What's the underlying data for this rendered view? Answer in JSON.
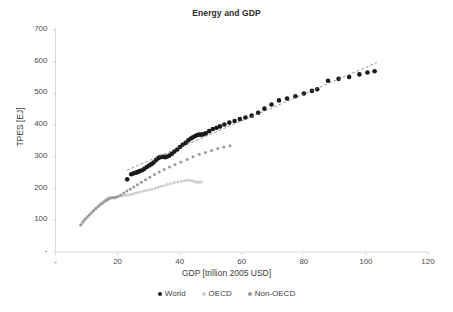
{
  "chart_data": {
    "type": "scatter",
    "title": "Energy and GDP",
    "xlabel": "GDP [trillion 2005 USD]",
    "ylabel": "TPES [EJ]",
    "xlim": [
      0,
      120
    ],
    "ylim": [
      0,
      700
    ],
    "xticks": [
      "-",
      "20",
      "40",
      "60",
      "80",
      "100",
      "120"
    ],
    "xtick_values": [
      0,
      20,
      40,
      60,
      80,
      100,
      120
    ],
    "yticks": [
      "-",
      "100",
      "200",
      "300",
      "400",
      "500",
      "600",
      "700"
    ],
    "ytick_values": [
      0,
      100,
      200,
      300,
      400,
      500,
      600,
      700
    ],
    "grid": false,
    "legend_position": "bottom",
    "series": [
      {
        "name": "World",
        "color": "#1a1a1a",
        "marker": "circle",
        "points": [
          [
            23.1,
            229
          ],
          [
            24.4,
            245
          ],
          [
            25.2,
            248
          ],
          [
            25.9,
            250
          ],
          [
            26.4,
            252
          ],
          [
            27.1,
            255
          ],
          [
            27.9,
            258
          ],
          [
            28.6,
            262
          ],
          [
            29.4,
            268
          ],
          [
            30.2,
            273
          ],
          [
            30.9,
            277
          ],
          [
            31.6,
            282
          ],
          [
            32.4,
            290
          ],
          [
            33.1,
            296
          ],
          [
            33.7,
            299
          ],
          [
            34.3,
            300
          ],
          [
            34.9,
            300
          ],
          [
            35.4,
            299
          ],
          [
            36.0,
            301
          ],
          [
            36.7,
            304
          ],
          [
            37.5,
            310
          ],
          [
            38.3,
            317
          ],
          [
            39.2,
            323
          ],
          [
            40.1,
            331
          ],
          [
            41.0,
            338
          ],
          [
            41.9,
            344
          ],
          [
            42.8,
            352
          ],
          [
            43.6,
            358
          ],
          [
            44.3,
            362
          ],
          [
            45.0,
            366
          ],
          [
            45.7,
            369
          ],
          [
            46.3,
            370
          ],
          [
            46.9,
            370
          ],
          [
            47.6,
            371
          ],
          [
            48.4,
            374
          ],
          [
            49.5,
            381
          ],
          [
            50.7,
            388
          ],
          [
            51.9,
            392
          ],
          [
            53.0,
            396
          ],
          [
            54.4,
            402
          ],
          [
            56.0,
            408
          ],
          [
            57.7,
            413
          ],
          [
            59.4,
            419
          ],
          [
            61.2,
            424
          ],
          [
            63.2,
            430
          ],
          [
            65.3,
            439
          ],
          [
            67.3,
            452
          ],
          [
            69.6,
            465
          ],
          [
            72.0,
            478
          ],
          [
            74.6,
            484
          ],
          [
            77.3,
            491
          ],
          [
            80.0,
            500
          ],
          [
            82.6,
            508
          ],
          [
            84.3,
            513
          ],
          [
            87.8,
            540
          ],
          [
            91.2,
            546
          ],
          [
            94.6,
            552
          ],
          [
            97.9,
            560
          ],
          [
            100.5,
            566
          ],
          [
            102.8,
            570
          ]
        ]
      },
      {
        "name": "OECD",
        "color": "#cfcfcf",
        "marker": "circle",
        "points": [
          [
            8.0,
            84
          ],
          [
            8.6,
            92
          ],
          [
            9.2,
            100
          ],
          [
            9.8,
            106
          ],
          [
            10.4,
            112
          ],
          [
            11.0,
            118
          ],
          [
            11.6,
            124
          ],
          [
            12.2,
            130
          ],
          [
            12.8,
            136
          ],
          [
            13.4,
            142
          ],
          [
            14.0,
            148
          ],
          [
            14.6,
            153
          ],
          [
            15.2,
            158
          ],
          [
            15.8,
            163
          ],
          [
            16.4,
            167
          ],
          [
            17.0,
            171
          ],
          [
            17.6,
            173
          ],
          [
            18.2,
            172
          ],
          [
            18.8,
            170
          ],
          [
            19.4,
            172
          ],
          [
            20.0,
            174
          ],
          [
            20.7,
            176
          ],
          [
            21.4,
            177
          ],
          [
            22.1,
            178
          ],
          [
            22.8,
            179
          ],
          [
            23.5,
            180
          ],
          [
            24.3,
            182
          ],
          [
            25.1,
            184
          ],
          [
            25.9,
            186
          ],
          [
            26.7,
            188
          ],
          [
            27.5,
            190
          ],
          [
            28.4,
            192
          ],
          [
            29.3,
            194
          ],
          [
            30.2,
            196
          ],
          [
            31.1,
            198
          ],
          [
            32.1,
            201
          ],
          [
            33.1,
            204
          ],
          [
            34.1,
            207
          ],
          [
            35.1,
            210
          ],
          [
            36.1,
            213
          ],
          [
            37.2,
            216
          ],
          [
            38.3,
            219
          ],
          [
            39.4,
            221
          ],
          [
            40.5,
            223
          ],
          [
            41.6,
            225
          ],
          [
            42.5,
            226
          ],
          [
            43.3,
            226
          ],
          [
            44.0,
            225
          ],
          [
            44.6,
            222
          ],
          [
            45.2,
            221
          ],
          [
            45.8,
            220
          ],
          [
            46.4,
            220
          ],
          [
            47.0,
            221
          ]
        ]
      },
      {
        "name": "Non-OECD",
        "color": "#9a9a9a",
        "marker": "circle",
        "points": [
          [
            8.2,
            86
          ],
          [
            8.9,
            95
          ],
          [
            9.5,
            103
          ],
          [
            10.2,
            110
          ],
          [
            10.9,
            117
          ],
          [
            11.6,
            124
          ],
          [
            12.3,
            131
          ],
          [
            13.0,
            137
          ],
          [
            13.7,
            143
          ],
          [
            14.4,
            149
          ],
          [
            15.1,
            154
          ],
          [
            15.8,
            159
          ],
          [
            16.5,
            163
          ],
          [
            17.2,
            167
          ],
          [
            17.9,
            170
          ],
          [
            18.6,
            172
          ],
          [
            19.3,
            173
          ],
          [
            20.1,
            175
          ],
          [
            21.0,
            180
          ],
          [
            22.0,
            186
          ],
          [
            23.0,
            192
          ],
          [
            24.1,
            198
          ],
          [
            25.2,
            205
          ],
          [
            26.4,
            212
          ],
          [
            27.7,
            220
          ],
          [
            29.0,
            228
          ],
          [
            30.4,
            236
          ],
          [
            31.9,
            244
          ],
          [
            33.4,
            252
          ],
          [
            35.0,
            260
          ],
          [
            36.7,
            268
          ],
          [
            38.5,
            276
          ],
          [
            40.4,
            284
          ],
          [
            42.4,
            292
          ],
          [
            44.3,
            300
          ],
          [
            46.3,
            308
          ],
          [
            48.3,
            314
          ],
          [
            50.3,
            320
          ],
          [
            52.3,
            326
          ],
          [
            54.2,
            331
          ],
          [
            56.2,
            335
          ]
        ]
      }
    ],
    "trendline": {
      "name": "World linear trend",
      "color": "#6b6b6b",
      "style": "dashed",
      "x_start": 23.0,
      "y_start": 258,
      "x_end": 103.5,
      "y_end": 597
    }
  },
  "legend": {
    "items": [
      {
        "label": "World",
        "color": "#1a1a1a"
      },
      {
        "label": "OECD",
        "color": "#d2d2d2"
      },
      {
        "label": "Non-OECD",
        "color": "#9a9a9a"
      }
    ]
  },
  "axes": {
    "axis_line_color": "#d9d9d9"
  }
}
